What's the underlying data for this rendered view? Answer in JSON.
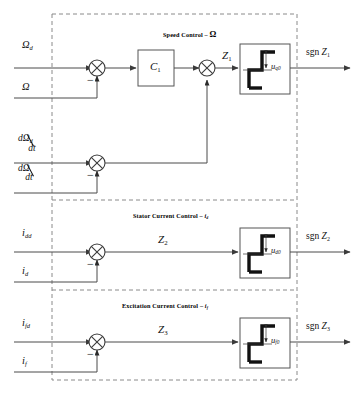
{
  "figure": {
    "type": "control-block-diagram",
    "background": "#ffffff",
    "line_color": "#4a4a4a",
    "dash_color": "#8a8a8a"
  },
  "sections": [
    {
      "id": "speed",
      "header": "Speed Control  –  ",
      "header_symbol": "Ω",
      "inputs": [
        {
          "name": "reference",
          "text": "Ω",
          "sub": "d"
        },
        {
          "name": "feedback",
          "text": "Ω",
          "sub": ""
        }
      ],
      "derivative_inputs": [
        {
          "name": "reference-derivative",
          "num": "dΩ",
          "num_sub": "d",
          "den": "dt"
        },
        {
          "name": "feedback-derivative",
          "num": "dΩ",
          "num_sub": "",
          "den": "dt"
        }
      ],
      "controller_block": {
        "label": "C",
        "sub": "1"
      },
      "signal": {
        "label": "Z",
        "sub": "1"
      },
      "relay": {
        "label": "u",
        "sub": "q0"
      },
      "output": {
        "prefix": "sgn ",
        "label": "Z",
        "sub": "1"
      },
      "sum_sign": "−"
    },
    {
      "id": "stator-current",
      "header": "Stator Current Control  –  ",
      "header_symbol": "i",
      "header_symbol_sub": "d",
      "inputs": [
        {
          "name": "reference",
          "text": "i",
          "sub": "dd"
        },
        {
          "name": "feedback",
          "text": "i",
          "sub": "d"
        }
      ],
      "signal": {
        "label": "Z",
        "sub": "2"
      },
      "relay": {
        "label": "u",
        "sub": "d0"
      },
      "output": {
        "prefix": "sgn ",
        "label": "Z",
        "sub": "2"
      },
      "sum_sign": "−"
    },
    {
      "id": "excitation-current",
      "header": "Excitation Current Control  –  ",
      "header_symbol": "i",
      "header_symbol_sub": "f",
      "inputs": [
        {
          "name": "reference",
          "text": "i",
          "sub": "fd"
        },
        {
          "name": "feedback",
          "text": "i",
          "sub": "f"
        }
      ],
      "signal": {
        "label": "Z",
        "sub": "3"
      },
      "relay": {
        "label": "u",
        "sub": "f0"
      },
      "output": {
        "prefix": "sgn ",
        "label": "Z",
        "sub": "3"
      },
      "sum_sign": "−"
    }
  ]
}
